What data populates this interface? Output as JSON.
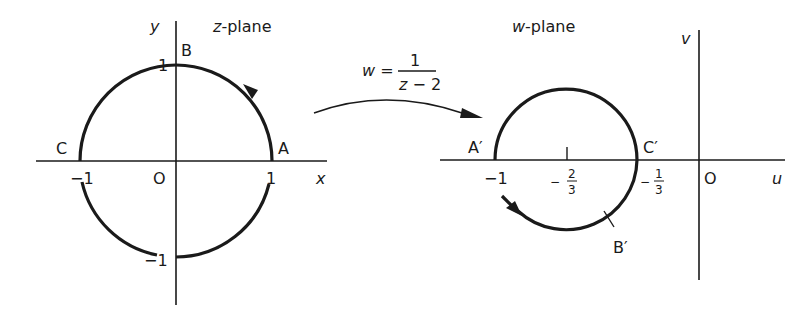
{
  "z_plane": {
    "title_var": "z",
    "title_rest": "-plane",
    "x_axis_label": "x",
    "y_axis_label": "y",
    "origin_label": "O",
    "ticks": {
      "x_pos": "1",
      "x_neg": "−1",
      "y_pos": "1",
      "y_neg": "−1"
    },
    "points": {
      "A": "A",
      "B": "B",
      "C": "C"
    },
    "circle": {
      "center": [
        0,
        0
      ],
      "radius": 1
    }
  },
  "mapping": {
    "lhs": "w =",
    "numerator": "1",
    "denominator": "z − 2"
  },
  "w_plane": {
    "title_var": "w",
    "title_rest": "-plane",
    "u_axis_label": "u",
    "v_axis_label": "v",
    "origin_label": "O",
    "ticks": {
      "minus_one": "−1",
      "minus_two_thirds_sign": "−",
      "minus_two_thirds_num": "2",
      "minus_two_thirds_den": "3",
      "minus_one_third_sign": "−",
      "minus_one_third_num": "1",
      "minus_one_third_den": "3"
    },
    "points": {
      "A": "A′",
      "B": "B′",
      "C": "C′"
    },
    "circle": {
      "center": [
        -0.6667,
        0
      ],
      "radius": 0.3333
    }
  },
  "colors": {
    "ink": "#1a1a1a",
    "background": "#ffffff"
  }
}
